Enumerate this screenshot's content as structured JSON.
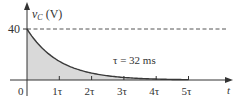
{
  "chart_data": {
    "type": "area",
    "title": "",
    "function": "v_C = 40 e^(-t/tau)",
    "ylabel": {
      "var": "v",
      "sub": "C",
      "unit": "(V)"
    },
    "xlabel": "t",
    "annotation": "τ = 32 ms",
    "y_ticks": [
      {
        "value": 40,
        "label": "40"
      }
    ],
    "x_ticks": [
      {
        "value": 0,
        "label": "0"
      },
      {
        "value": 1,
        "label": "1τ"
      },
      {
        "value": 2,
        "label": "2τ"
      },
      {
        "value": 3,
        "label": "3τ"
      },
      {
        "value": 4,
        "label": "4τ"
      },
      {
        "value": 5,
        "label": "5τ"
      }
    ],
    "x": [
      0,
      1,
      2,
      3,
      4,
      5
    ],
    "values": [
      40,
      14.7,
      5.4,
      2.0,
      0.73,
      0.27
    ],
    "reference_line": {
      "value": 40,
      "style": "dashed"
    },
    "ylim": [
      0,
      40
    ],
    "xlim": [
      0,
      6.3
    ],
    "grid": false,
    "legend": null,
    "colors": {
      "curve": "#3a3a3a",
      "fill": "#d9d9d9",
      "axis": "#333333",
      "dashed": "#555555"
    }
  }
}
